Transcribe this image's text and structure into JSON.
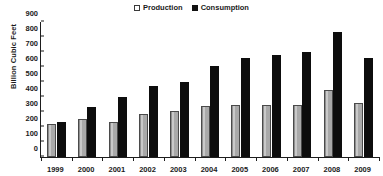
{
  "legend": {
    "position": "top-center",
    "entries": [
      {
        "label": "Production",
        "swatch": "white-square-outline",
        "color": "#ffffff"
      },
      {
        "label": "Consumption",
        "swatch": "black-square",
        "color": "#111111"
      }
    ]
  },
  "axes": {
    "ylabel": "Billion Cubic Feet",
    "xlabel": "",
    "yticks": [
      "0",
      "100",
      "200",
      "300",
      "400",
      "500",
      "600",
      "700",
      "800",
      "900"
    ]
  },
  "chart_data": {
    "type": "bar",
    "title": "",
    "subtitle": "",
    "xlabel": "",
    "ylabel": "Billion Cubic Feet",
    "ylim": [
      0,
      900
    ],
    "ytick_step": 100,
    "grid": false,
    "legend_position": "top-center",
    "categories": [
      "1999",
      "2000",
      "2001",
      "2002",
      "2003",
      "2004",
      "2005",
      "2006",
      "2007",
      "2008",
      "2009"
    ],
    "series": [
      {
        "name": "Production",
        "color": "#a8a8a8",
        "values": [
          220,
          253,
          235,
          287,
          310,
          340,
          345,
          348,
          345,
          447,
          363
        ]
      },
      {
        "name": "Consumption",
        "color": "#0d0d0d",
        "values": [
          233,
          333,
          397,
          473,
          500,
          607,
          657,
          683,
          700,
          833,
          660
        ]
      }
    ]
  }
}
